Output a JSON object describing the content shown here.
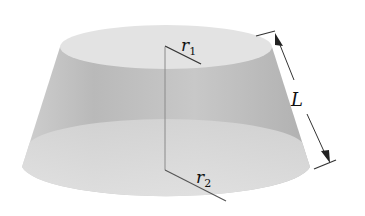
{
  "figure": {
    "labels": {
      "top_radius": {
        "base": "r",
        "subscript": "1"
      },
      "bottom_radius": {
        "base": "r",
        "subscript": "2"
      },
      "slant_height": {
        "base": "L"
      }
    }
  },
  "colors": {
    "top_face": "#e2e2e2",
    "lateral_light": "#d4d4d4",
    "lateral_dark": "#b4b4b4",
    "bottom_band": "#dcdcdc",
    "lines": "#333333",
    "axis_line": "#8a8a8a"
  }
}
